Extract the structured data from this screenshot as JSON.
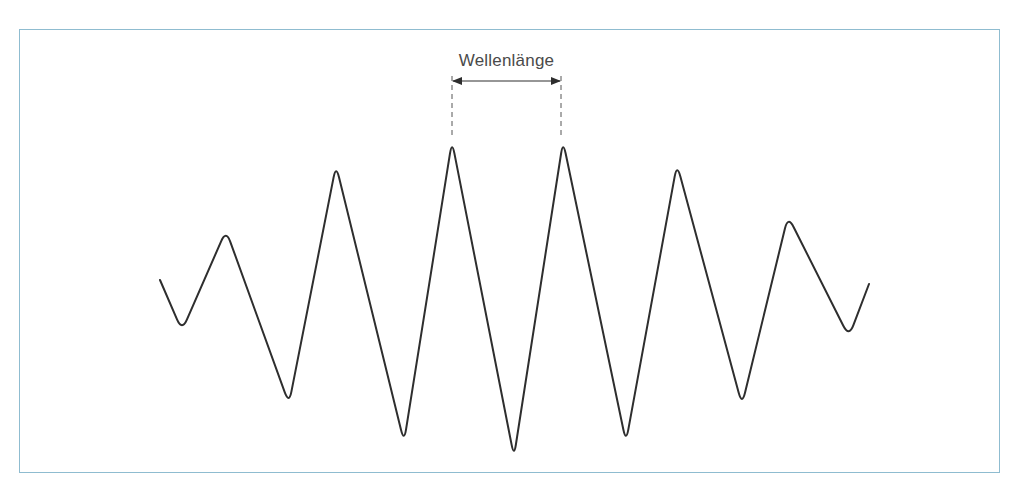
{
  "diagram": {
    "type": "wave",
    "frame_color": "#8fbcd0",
    "line_color": "#2e2e2e",
    "label_color": "#4a4a4a",
    "annotation": {
      "label": "Wellenlänge",
      "from_x": 452,
      "to_x": 561,
      "arrow_y": 81
    },
    "wave_points": [
      [
        160,
        280
      ],
      [
        182,
        331
      ],
      [
        226,
        230
      ],
      [
        289,
        404
      ],
      [
        336,
        165
      ],
      [
        404,
        442
      ],
      [
        452,
        141
      ],
      [
        514,
        457
      ],
      [
        563,
        141
      ],
      [
        626,
        442
      ],
      [
        677,
        164
      ],
      [
        742,
        405
      ],
      [
        788,
        216
      ],
      [
        849,
        337
      ],
      [
        869,
        284
      ]
    ]
  }
}
